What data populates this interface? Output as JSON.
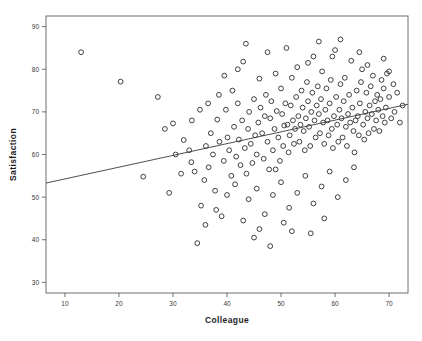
{
  "chart_data": {
    "type": "scatter",
    "title": "",
    "xlabel": "Colleague",
    "ylabel": "Satisfaction",
    "xlim": [
      6.5,
      73.5
    ],
    "ylim": [
      27.5,
      92.5
    ],
    "xticks": [
      10,
      20,
      30,
      40,
      50,
      60,
      70
    ],
    "xticklabels": [
      "10",
      "20",
      "30",
      "40",
      "50",
      "60",
      "70"
    ],
    "yticks": [
      30,
      40,
      50,
      60,
      70,
      80,
      90
    ],
    "yticklabels": [
      "30",
      "40",
      "50",
      "60",
      "70",
      "80",
      "90"
    ],
    "grid": false,
    "legend": null,
    "marker": "open-circle",
    "marker_color": "#2b2b2b",
    "frame_color": "#6e6e6e",
    "fit_line": {
      "type": "linear-regression",
      "x_start": 6.5,
      "y_start": 53.3,
      "x_end": 73.5,
      "y_end": 71.8,
      "slope": 0.276,
      "intercept": 51.5,
      "style": "solid-thin"
    },
    "points": [
      [
        13.0,
        84.0
      ],
      [
        20.3,
        77.1
      ],
      [
        27.2,
        73.5
      ],
      [
        30.0,
        67.3
      ],
      [
        24.5,
        54.8
      ],
      [
        29.3,
        51.0
      ],
      [
        32.0,
        63.4
      ],
      [
        33.4,
        58.2
      ],
      [
        34.5,
        39.2
      ],
      [
        35.2,
        48.0
      ],
      [
        35.8,
        54.0
      ],
      [
        36.1,
        62.0
      ],
      [
        36.6,
        57.0
      ],
      [
        37.0,
        65.0
      ],
      [
        37.4,
        60.0
      ],
      [
        37.8,
        51.5
      ],
      [
        38.2,
        68.2
      ],
      [
        38.6,
        63.0
      ],
      [
        39.0,
        45.5
      ],
      [
        39.4,
        58.5
      ],
      [
        39.8,
        70.5
      ],
      [
        40.1,
        64.0
      ],
      [
        40.4,
        61.0
      ],
      [
        40.8,
        55.0
      ],
      [
        41.0,
        75.0
      ],
      [
        41.3,
        66.5
      ],
      [
        41.7,
        59.5
      ],
      [
        42.0,
        72.0
      ],
      [
        42.2,
        63.5
      ],
      [
        42.5,
        57.5
      ],
      [
        42.8,
        68.0
      ],
      [
        43.0,
        81.8
      ],
      [
        43.3,
        61.5
      ],
      [
        43.6,
        55.5
      ],
      [
        43.9,
        66.0
      ],
      [
        44.1,
        70.0
      ],
      [
        44.4,
        62.5
      ],
      [
        44.7,
        58.0
      ],
      [
        45.0,
        73.0
      ],
      [
        45.2,
        64.5
      ],
      [
        45.5,
        60.0
      ],
      [
        45.8,
        67.5
      ],
      [
        46.0,
        77.8
      ],
      [
        46.2,
        71.0
      ],
      [
        46.5,
        65.0
      ],
      [
        46.8,
        59.0
      ],
      [
        47.0,
        69.0
      ],
      [
        47.2,
        74.0
      ],
      [
        47.5,
        63.0
      ],
      [
        47.8,
        56.5
      ],
      [
        48.0,
        68.5
      ],
      [
        48.2,
        72.5
      ],
      [
        48.5,
        61.0
      ],
      [
        48.8,
        66.0
      ],
      [
        49.0,
        79.0
      ],
      [
        49.2,
        70.2
      ],
      [
        49.5,
        64.0
      ],
      [
        49.8,
        58.5
      ],
      [
        50.0,
        75.5
      ],
      [
        50.2,
        69.5
      ],
      [
        50.4,
        62.0
      ],
      [
        50.6,
        66.8
      ],
      [
        50.8,
        72.0
      ],
      [
        51.0,
        85.0
      ],
      [
        51.2,
        67.0
      ],
      [
        51.4,
        60.5
      ],
      [
        51.6,
        64.5
      ],
      [
        51.8,
        71.5
      ],
      [
        52.0,
        78.0
      ],
      [
        52.2,
        68.0
      ],
      [
        52.4,
        62.5
      ],
      [
        52.6,
        66.0
      ],
      [
        52.8,
        73.5
      ],
      [
        53.0,
        80.5
      ],
      [
        53.2,
        69.0
      ],
      [
        53.4,
        63.0
      ],
      [
        53.6,
        67.0
      ],
      [
        53.8,
        75.0
      ],
      [
        54.0,
        71.0
      ],
      [
        54.2,
        65.5
      ],
      [
        54.4,
        61.0
      ],
      [
        54.6,
        68.5
      ],
      [
        54.8,
        77.0
      ],
      [
        55.0,
        72.5
      ],
      [
        55.2,
        66.5
      ],
      [
        55.4,
        62.0
      ],
      [
        55.6,
        70.0
      ],
      [
        55.8,
        74.5
      ],
      [
        56.0,
        83.0
      ],
      [
        56.2,
        68.0
      ],
      [
        56.4,
        64.0
      ],
      [
        56.6,
        71.5
      ],
      [
        56.8,
        76.0
      ],
      [
        57.0,
        69.5
      ],
      [
        57.2,
        65.0
      ],
      [
        57.4,
        73.0
      ],
      [
        57.6,
        79.5
      ],
      [
        57.8,
        67.5
      ],
      [
        58.0,
        62.5
      ],
      [
        58.2,
        70.5
      ],
      [
        58.4,
        75.5
      ],
      [
        58.6,
        68.0
      ],
      [
        58.8,
        64.5
      ],
      [
        59.0,
        72.0
      ],
      [
        59.2,
        77.5
      ],
      [
        59.4,
        66.0
      ],
      [
        59.6,
        61.5
      ],
      [
        59.8,
        69.0
      ],
      [
        60.0,
        84.5
      ],
      [
        60.2,
        73.5
      ],
      [
        60.4,
        67.0
      ],
      [
        60.6,
        63.0
      ],
      [
        60.8,
        70.5
      ],
      [
        61.0,
        76.5
      ],
      [
        61.2,
        68.5
      ],
      [
        61.4,
        64.0
      ],
      [
        61.6,
        72.5
      ],
      [
        61.8,
        78.0
      ],
      [
        62.0,
        66.5
      ],
      [
        62.2,
        62.0
      ],
      [
        62.4,
        69.5
      ],
      [
        62.6,
        74.0
      ],
      [
        62.8,
        67.5
      ],
      [
        63.0,
        82.0
      ],
      [
        63.2,
        71.0
      ],
      [
        63.4,
        65.5
      ],
      [
        63.6,
        60.5
      ],
      [
        63.8,
        68.0
      ],
      [
        64.0,
        75.0
      ],
      [
        64.2,
        69.0
      ],
      [
        64.4,
        64.5
      ],
      [
        64.6,
        72.0
      ],
      [
        64.8,
        77.0
      ],
      [
        65.0,
        80.0
      ],
      [
        65.2,
        67.0
      ],
      [
        65.4,
        63.5
      ],
      [
        65.6,
        70.0
      ],
      [
        65.8,
        74.5
      ],
      [
        66.0,
        68.5
      ],
      [
        66.2,
        65.0
      ],
      [
        66.4,
        71.5
      ],
      [
        66.6,
        76.0
      ],
      [
        66.8,
        69.5
      ],
      [
        67.0,
        78.5
      ],
      [
        67.2,
        66.0
      ],
      [
        67.4,
        72.5
      ],
      [
        67.6,
        68.0
      ],
      [
        67.8,
        74.0
      ],
      [
        68.0,
        70.5
      ],
      [
        68.2,
        65.5
      ],
      [
        68.4,
        73.0
      ],
      [
        68.6,
        77.5
      ],
      [
        68.8,
        69.0
      ],
      [
        69.0,
        75.5
      ],
      [
        69.2,
        67.5
      ],
      [
        69.4,
        71.0
      ],
      [
        69.6,
        79.0
      ],
      [
        70.0,
        73.5
      ],
      [
        70.4,
        68.5
      ],
      [
        70.8,
        76.5
      ],
      [
        44.0,
        49.5
      ],
      [
        45.5,
        52.0
      ],
      [
        47.0,
        46.0
      ],
      [
        48.5,
        50.5
      ],
      [
        50.0,
        53.5
      ],
      [
        51.5,
        47.5
      ],
      [
        53.0,
        51.0
      ],
      [
        54.5,
        55.0
      ],
      [
        56.0,
        48.5
      ],
      [
        57.5,
        52.5
      ],
      [
        59.0,
        56.0
      ],
      [
        60.5,
        50.0
      ],
      [
        62.0,
        54.0
      ],
      [
        63.5,
        57.0
      ],
      [
        52.0,
        42.0
      ],
      [
        58.0,
        45.0
      ],
      [
        43.0,
        44.5
      ],
      [
        41.5,
        53.0
      ],
      [
        46.0,
        42.5
      ],
      [
        49.0,
        56.5
      ],
      [
        38.0,
        47.0
      ],
      [
        36.0,
        43.5
      ],
      [
        40.0,
        50.5
      ],
      [
        34.0,
        56.0
      ],
      [
        33.0,
        61.0
      ],
      [
        31.5,
        55.5
      ],
      [
        30.5,
        60.0
      ],
      [
        28.5,
        66.0
      ],
      [
        43.5,
        86.0
      ],
      [
        57.0,
        86.5
      ],
      [
        64.5,
        84.0
      ],
      [
        61.0,
        87.0
      ],
      [
        35.0,
        70.5
      ],
      [
        36.5,
        72.0
      ],
      [
        38.5,
        74.0
      ],
      [
        33.5,
        68.0
      ],
      [
        39.5,
        78.5
      ],
      [
        42.0,
        80.0
      ],
      [
        47.5,
        84.0
      ],
      [
        55.0,
        81.5
      ],
      [
        59.5,
        83.0
      ],
      [
        66.0,
        81.0
      ],
      [
        69.0,
        82.5
      ],
      [
        70.0,
        79.5
      ],
      [
        71.0,
        70.0
      ],
      [
        71.5,
        74.5
      ],
      [
        72.0,
        67.5
      ],
      [
        72.5,
        71.5
      ],
      [
        45.0,
        40.5
      ],
      [
        55.5,
        41.5
      ],
      [
        48.0,
        38.5
      ],
      [
        50.5,
        44.0
      ]
    ]
  }
}
